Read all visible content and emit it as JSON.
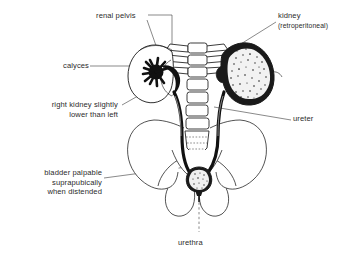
{
  "figure": {
    "background_color": "#ffffff",
    "ink_color": "#1a1a1a",
    "text_color": "#2b2b2b"
  },
  "labels": {
    "renal_pelvis": "renal pelvis",
    "kidney": "kidney",
    "kidney_sub": "(retroperitoneal)",
    "calyces": "calyces",
    "right_kidney_line1": "right kidney slightly",
    "right_kidney_line2": "lower than left",
    "ureter": "ureter",
    "bladder_line1": "bladder palpable",
    "bladder_line2": "suprapubically",
    "bladder_line3": "when distended",
    "urethra": "urethra"
  },
  "structures": [
    "right-kidney-outline",
    "left-kidney-stippled",
    "renal-calyces",
    "renal-pelvis",
    "right-ureter",
    "left-ureter",
    "vertebral-column",
    "sacrum",
    "pelvic-girdle",
    "urinary-bladder",
    "urethra"
  ]
}
